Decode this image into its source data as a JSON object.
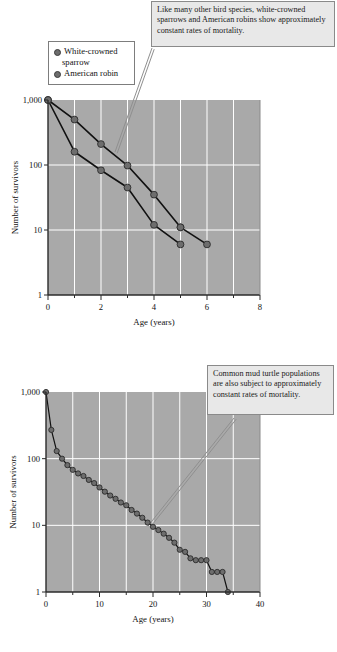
{
  "figure": {
    "background_color": "#a9a9a9",
    "gridline_color": "#ffffff",
    "marker_color": "#6d6d6d",
    "line_color": "#111111",
    "annotation_bg": "#e8e8e8"
  },
  "top": {
    "annotation": "Like many other bird species, white-crowned sparrows and American robins show approximately constant rates of mortality.",
    "legend": {
      "items": [
        {
          "label": "White-crowned sparrow",
          "label_line1": "White-crowned",
          "label_line2": "sparrow",
          "color": "#6d6d6d"
        },
        {
          "label": "American robin",
          "label_line1": "American robin",
          "label_line2": "",
          "color": "#6d6d6d"
        }
      ]
    },
    "chart_data": {
      "type": "line",
      "title": "",
      "xlabel": "Age (years)",
      "ylabel": "Number of survivors",
      "yscale": "log",
      "xlim": [
        0,
        8
      ],
      "ylim": [
        1,
        1000
      ],
      "xticks": [
        0,
        1,
        2,
        3,
        4,
        5,
        6,
        7,
        8
      ],
      "xticklabels": [
        "0",
        "",
        "2",
        "",
        "4",
        "",
        "6",
        "",
        "8"
      ],
      "yticks": [
        1,
        10,
        100,
        1000
      ],
      "yticklabels": [
        "1",
        "10",
        "100",
        "1,000"
      ],
      "grid": true,
      "legend_position": "upper-left-outside",
      "series": [
        {
          "name": "White-crowned sparrow",
          "x": [
            0,
            1,
            2,
            3,
            4,
            5
          ],
          "values": [
            1000,
            500,
            210,
            98,
            35,
            11
          ]
        },
        {
          "name": "American robin",
          "x": [
            0,
            1,
            2,
            3,
            4,
            5
          ],
          "values": [
            1000,
            160,
            83,
            45,
            12,
            6
          ]
        },
        {
          "name": "White-crowned sparrow tail",
          "x": [
            5,
            6
          ],
          "values": [
            11,
            6
          ]
        }
      ]
    }
  },
  "bottom": {
    "annotation": "Common mud turtle populations are also subject to approximately constant rates of mortality.",
    "chart_data": {
      "type": "line",
      "title": "",
      "xlabel": "Age (years)",
      "ylabel": "Number of survivors",
      "yscale": "log",
      "xlim": [
        0,
        40
      ],
      "ylim": [
        1,
        1000
      ],
      "xticks": [
        0,
        5,
        10,
        15,
        20,
        25,
        30,
        35,
        40
      ],
      "xticklabels": [
        "0",
        "",
        "10",
        "",
        "20",
        "",
        "30",
        "",
        "40"
      ],
      "yticks": [
        1,
        10,
        100,
        1000
      ],
      "yticklabels": [
        "1",
        "10",
        "100",
        "1,000"
      ],
      "grid": true,
      "series": [
        {
          "name": "Common mud turtle",
          "x": [
            0,
            1,
            2,
            3,
            4,
            5,
            6,
            7,
            8,
            9,
            10,
            11,
            12,
            13,
            14,
            15,
            16,
            17,
            18,
            19,
            20,
            21,
            22,
            23,
            24,
            25,
            26,
            27,
            28,
            29,
            30,
            31,
            32,
            33,
            34
          ],
          "values": [
            1000,
            270,
            130,
            100,
            80,
            68,
            60,
            55,
            48,
            43,
            37,
            32,
            28,
            25,
            22,
            20,
            17,
            15,
            13,
            11,
            9.5,
            8.5,
            7.5,
            6.5,
            5.5,
            4.3,
            4.0,
            3.2,
            3.0,
            3.0,
            3.0,
            2.0,
            2.0,
            2.0,
            1.0
          ]
        }
      ]
    }
  }
}
